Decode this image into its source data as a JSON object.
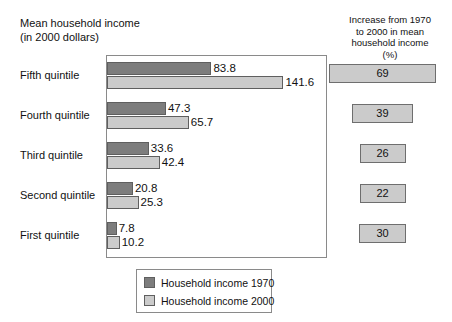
{
  "left_title": "Mean household income\n(in 2000 dollars)",
  "right_title": "Increase from 1970\nto 2000 in mean\nhousehold income\n(%)",
  "legend": {
    "items": [
      {
        "label": "Household income 1970",
        "color": "#7d7d7d",
        "swatch_name": "legend-swatch-1970"
      },
      {
        "label": "Household income 2000",
        "color": "#cbcbcb",
        "swatch_name": "legend-swatch-2000"
      }
    ]
  },
  "rows": [
    {
      "category": "Fifth quintile",
      "v1970": "83.8",
      "v2000": "141.6",
      "pct": "69"
    },
    {
      "category": "Fourth quintile",
      "v1970": "47.3",
      "v2000": "65.7",
      "pct": "39"
    },
    {
      "category": "Third quintile",
      "v1970": "33.6",
      "v2000": "42.4",
      "pct": "26"
    },
    {
      "category": "Second quintile",
      "v1970": "20.8",
      "v2000": "25.3",
      "pct": "22"
    },
    {
      "category": "First quintile",
      "v1970": "7.8",
      "v2000": "10.2",
      "pct": "30"
    }
  ],
  "colors": {
    "series_1970": "#7d7d7d",
    "series_2000": "#cbcbcb",
    "box_fill": "#cbcbcb",
    "frame": "#8a8a8a",
    "background": "#ffffff"
  },
  "chart_data": {
    "type": "bar",
    "title": "Mean household income (in 2000 dollars)",
    "orientation": "horizontal",
    "categories": [
      "Fifth quintile",
      "Fourth quintile",
      "Third quintile",
      "Second quintile",
      "First quintile"
    ],
    "series": [
      {
        "name": "Household income 1970",
        "values": [
          83.8,
          47.3,
          33.6,
          20.8,
          7.8
        ],
        "color": "#7d7d7d"
      },
      {
        "name": "Household income 2000",
        "values": [
          141.6,
          65.7,
          42.4,
          25.3,
          10.2
        ],
        "color": "#cbcbcb"
      }
    ],
    "xlabel": "",
    "ylabel": "",
    "xlim": [
      0,
      177
    ],
    "grid": false,
    "legend_position": "bottom",
    "data_labels": true,
    "side_panel": {
      "title": "Increase from 1970 to 2000 in mean household income (%)",
      "type": "table",
      "categories": [
        "Fifth quintile",
        "Fourth quintile",
        "Third quintile",
        "Second quintile",
        "First quintile"
      ],
      "values": [
        69,
        39,
        26,
        22,
        30
      ],
      "unit": "%"
    }
  }
}
